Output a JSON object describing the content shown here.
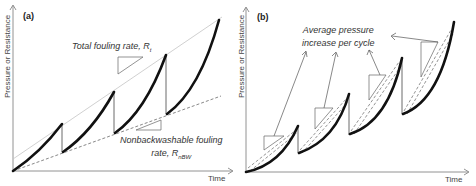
{
  "panel_a": {
    "tag": "(a)",
    "y_axis_label": "Pressure or Resistance",
    "x_axis_label": "Time",
    "annotation_total": {
      "text": "Total fouling rate, R",
      "sub": "t"
    },
    "annotation_nbw": {
      "line1": "Nonbackwashable fouling",
      "line2": "rate, R",
      "sub": "nBW"
    }
  },
  "panel_b": {
    "tag": "(b)",
    "y_axis_label": "Pressure or Resistance",
    "x_axis_label": "Time",
    "annotation": {
      "line1": "Average pressure",
      "line2": "increase per cycle"
    }
  },
  "colors": {
    "curve": "#111111",
    "axis": "#666666",
    "total_line": "#bbbbbb",
    "dashed": "#555555",
    "text": "#333333"
  }
}
